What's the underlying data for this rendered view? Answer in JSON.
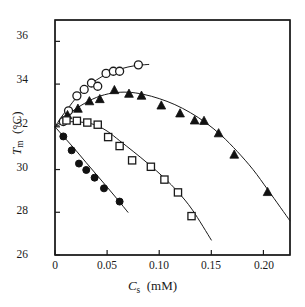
{
  "chart_data": {
    "type": "scatter",
    "title": "",
    "xlabel": "C_s (mM)",
    "ylabel": "T_m (°C)",
    "xlim": [
      0,
      0.2255
    ],
    "ylim": [
      26,
      37
    ],
    "grid": false,
    "legend": "none",
    "xticks": [
      0,
      0.05,
      0.1,
      0.15,
      0.2
    ],
    "xtick_labels": [
      "0",
      "0.05",
      "0.10",
      "0.15",
      "0.20"
    ],
    "yticks": [
      26,
      28,
      30,
      32,
      34,
      36
    ],
    "ytick_labels": [
      "26",
      "28",
      "30",
      "32",
      "34",
      "36"
    ],
    "series": [
      {
        "name": "open-circles",
        "marker": "circle-open",
        "x": [
          0.008,
          0.013,
          0.021,
          0.028,
          0.035,
          0.041,
          0.049,
          0.056,
          0.062,
          0.08
        ],
        "y": [
          32.25,
          32.75,
          33.45,
          33.75,
          34.05,
          33.9,
          34.5,
          34.6,
          34.6,
          34.9
        ],
        "curve": {
          "x": [
            0.0,
            0.006,
            0.013,
            0.021,
            0.03,
            0.04,
            0.05,
            0.06,
            0.07,
            0.08,
            0.09
          ],
          "y": [
            32.0,
            32.45,
            32.9,
            33.4,
            33.85,
            34.2,
            34.48,
            34.66,
            34.8,
            34.88,
            34.92
          ]
        }
      },
      {
        "name": "filled-triangles",
        "marker": "triangle-filled",
        "x": [
          0.012,
          0.022,
          0.033,
          0.043,
          0.057,
          0.071,
          0.083,
          0.102,
          0.12,
          0.134,
          0.143,
          0.157,
          0.172,
          0.204
        ],
        "y": [
          32.55,
          32.85,
          33.2,
          33.3,
          33.72,
          33.55,
          33.46,
          33.0,
          32.63,
          32.3,
          32.28,
          31.7,
          30.7,
          28.95
        ],
        "curve": {
          "x": [
            0.0,
            0.012,
            0.025,
            0.04,
            0.055,
            0.07,
            0.085,
            0.1,
            0.115,
            0.13,
            0.145,
            0.16,
            0.175,
            0.19,
            0.205,
            0.2255
          ],
          "y": [
            32.0,
            32.55,
            33.0,
            33.38,
            33.58,
            33.62,
            33.52,
            33.32,
            33.04,
            32.66,
            32.18,
            31.58,
            30.84,
            30.0,
            29.0,
            27.6
          ]
        }
      },
      {
        "name": "open-squares",
        "marker": "square-open",
        "x": [
          0.011,
          0.021,
          0.031,
          0.041,
          0.051,
          0.062,
          0.074,
          0.092,
          0.105,
          0.118,
          0.131
        ],
        "y": [
          32.3,
          32.28,
          32.2,
          32.1,
          31.52,
          31.1,
          30.43,
          30.13,
          29.53,
          28.93,
          27.82
        ],
        "curve": {
          "x": [
            0.0,
            0.012,
            0.025,
            0.038,
            0.05,
            0.062,
            0.075,
            0.09,
            0.105,
            0.118,
            0.132,
            0.15
          ],
          "y": [
            32.0,
            32.22,
            32.22,
            32.1,
            31.8,
            31.35,
            30.85,
            30.25,
            29.6,
            28.95,
            28.1,
            26.7
          ]
        }
      },
      {
        "name": "filled-circles",
        "marker": "circle-filled",
        "x": [
          0.008,
          0.016,
          0.023,
          0.03,
          0.038,
          0.047,
          0.062
        ],
        "y": [
          31.55,
          30.9,
          30.28,
          29.98,
          29.62,
          29.12,
          28.5
        ],
        "curve": {
          "x": [
            0.0,
            0.01,
            0.02,
            0.03,
            0.04,
            0.05,
            0.06,
            0.07
          ],
          "y": [
            32.0,
            31.45,
            30.9,
            30.32,
            29.75,
            29.18,
            28.6,
            28.0
          ]
        }
      }
    ]
  },
  "axes": {
    "xlabel_symbol": "C",
    "xlabel_subscript": "s",
    "xlabel_unit": "(mM)",
    "ylabel_symbol": "T",
    "ylabel_subscript": "m",
    "ylabel_unit": "(°C)"
  },
  "style": {
    "axis_color": "#1a1a1a",
    "curve_color": "#1a1a1a",
    "marker_fill_open": "#ffffff",
    "marker_fill_solid": "#111111",
    "background": "#ffffff"
  }
}
